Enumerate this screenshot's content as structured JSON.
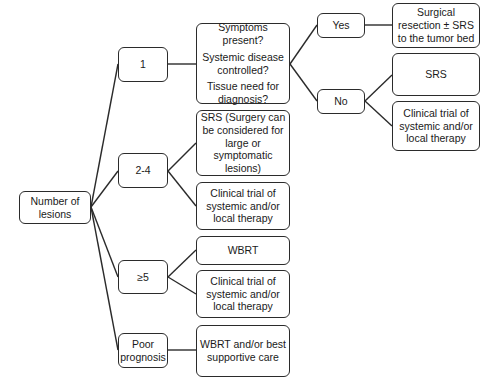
{
  "flowchart": {
    "root": {
      "label": "Number of lesions"
    },
    "branches": [
      {
        "label": "1"
      },
      {
        "label": "2-4"
      },
      {
        "label": "≥5"
      },
      {
        "label": "Poor prognosis"
      }
    ],
    "question": {
      "lines": [
        "Symptoms present?",
        "Systemic disease controlled?",
        "Tissue need for diagnosis?"
      ]
    },
    "answers": {
      "yes": "Yes",
      "no": "No"
    },
    "outcomes": {
      "yes_surgical": "Surgical resection ± SRS to the tumor bed",
      "no_srs": "SRS",
      "no_clinical": "Clinical trial of systemic and/or local therapy",
      "two_four_srs": "SRS (Surgery can be considered for large or symptomatic lesions)",
      "two_four_clinical": "Clinical trial of systemic and/or local therapy",
      "five_wbrt": "WBRT",
      "five_clinical": "Clinical trial of systemic and/or local therapy",
      "poor_wbrt": "WBRT and/or best supportive care"
    },
    "colors": {
      "border": "#2b2b2b",
      "background": "#ffffff",
      "text": "#1a1a1a"
    }
  }
}
